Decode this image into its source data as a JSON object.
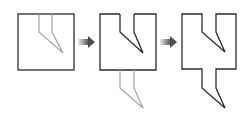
{
  "diagram": {
    "colors": {
      "outline": "#2b2b2b",
      "ghost": "#a0a0a0",
      "arrow_start": "#e8e8e8",
      "arrow_end": "#555555"
    },
    "steps": [
      {
        "id": "step-1",
        "label": ""
      },
      {
        "id": "step-2",
        "label": ""
      },
      {
        "id": "step-3",
        "label": ""
      }
    ],
    "arrows": [
      {
        "id": "arrow-1",
        "from": "step-1",
        "to": "step-2"
      },
      {
        "id": "arrow-2",
        "from": "step-2",
        "to": "step-3"
      }
    ]
  }
}
